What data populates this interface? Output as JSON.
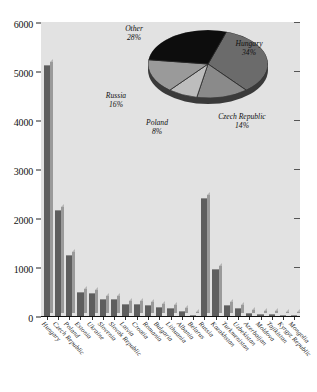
{
  "chart_data": {
    "type": "bar",
    "title": "",
    "xlabel": "",
    "ylabel": "",
    "ylim": [
      0,
      6000
    ],
    "yticks": [
      0,
      1000,
      2000,
      3000,
      4000,
      5000,
      6000
    ],
    "ytick_labels": [
      "0",
      "1000",
      "2000",
      "3000",
      "4000",
      "5000",
      "6000"
    ],
    "grid": false,
    "categories": [
      "Hungary",
      "Czech Republic",
      "Poland",
      "Estonia",
      "Ukraine",
      "Slovenia",
      "Slovak Republic",
      "Latvia",
      "Croatia",
      "Romania",
      "Bulgaria",
      "Lithuania",
      "Albania",
      "Belarus",
      "Russia",
      "Kazakhstan",
      "Turkmenistan",
      "Uzbekistan",
      "Azerbaijan",
      "Moldova",
      "Tajikistan",
      "Kyrgyz Republic",
      "Mongolia"
    ],
    "values": [
      5120,
      2160,
      1250,
      480,
      475,
      350,
      350,
      250,
      245,
      225,
      175,
      165,
      100,
      30,
      2400,
      950,
      230,
      165,
      70,
      45,
      40,
      30,
      25
    ],
    "inset_chart": {
      "type": "pie",
      "labels": [
        "Hungary",
        "Czech Republic",
        "Poland",
        "Russia",
        "Other"
      ],
      "values": [
        34,
        14,
        8,
        16,
        28
      ],
      "value_labels": [
        "34%",
        "14%",
        "8%",
        "16%",
        "28%"
      ],
      "colors": [
        "#6b6b6b",
        "#8a8a8a",
        "#bdbdbd",
        "#9a9a9a",
        "#0d0d0d"
      ]
    }
  },
  "colors": {
    "plot_background": "#e2e2e2",
    "bar_front": "#5e5e5e",
    "bar_side": "#9a9a9a",
    "axis": "#111111",
    "page_background": "#ffffff"
  },
  "pie_labels": {
    "other": {
      "name": "Other",
      "pct": "28%"
    },
    "hungary": {
      "name": "Hungary",
      "pct": "34%"
    },
    "czech": {
      "name": "Czech Republic",
      "pct": "14%"
    },
    "poland": {
      "name": "Poland",
      "pct": "8%"
    },
    "russia": {
      "name": "Russia",
      "pct": "16%"
    }
  }
}
